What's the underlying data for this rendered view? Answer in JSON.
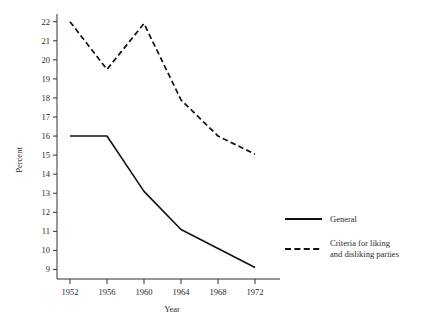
{
  "chart_data": {
    "type": "line",
    "title": "",
    "xlabel": "Year",
    "ylabel": "Percent",
    "x": [
      1952,
      1956,
      1960,
      1964,
      1968,
      1972
    ],
    "xticklabels": [
      "1952",
      "1956",
      "1960",
      "1964",
      "1968",
      "1972"
    ],
    "yticks": [
      9,
      10,
      11,
      12,
      13,
      14,
      15,
      16,
      17,
      18,
      19,
      20,
      21,
      22
    ],
    "yticklabels": [
      "9",
      "10",
      "11",
      "12",
      "13",
      "14",
      "15",
      "16",
      "17",
      "18",
      "19",
      "20",
      "21",
      "22"
    ],
    "ylim": [
      8.5,
      22.3
    ],
    "xlim": [
      1950.6,
      1973.4
    ],
    "grid": false,
    "legend_position": "right",
    "series": [
      {
        "name": "General",
        "style": "solid",
        "color": "#111111",
        "values": [
          16.0,
          16.0,
          13.1,
          11.1,
          10.1,
          9.1
        ]
      },
      {
        "name": "Criteria for liking and disliking parties",
        "style": "dashed",
        "color": "#111111",
        "values": [
          22.0,
          19.5,
          21.9,
          17.9,
          16.0,
          15.05
        ]
      }
    ]
  },
  "legend": {
    "entries": [
      {
        "label": "General",
        "label_line2": ""
      },
      {
        "label": "Criteria for liking",
        "label_line2": "and disliking parties"
      }
    ]
  },
  "axes": {
    "y_title": "Percent",
    "x_title": "Year"
  }
}
